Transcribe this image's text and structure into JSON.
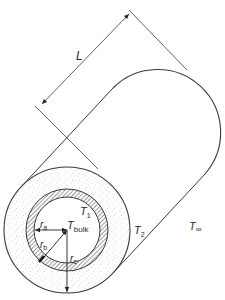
{
  "figure": {
    "type": "insulated pipe cross-section with cylinder length",
    "labels": {
      "length": "L",
      "r_a": {
        "main": "r",
        "sub": "a"
      },
      "r_b": {
        "main": "r",
        "sub": "b"
      },
      "r_c": {
        "main": "r",
        "sub": "c"
      },
      "t_bulk": {
        "main": "T",
        "sub": "bulk"
      },
      "t_1": {
        "main": "T",
        "sub": "1"
      },
      "t_2": {
        "main": "T",
        "sub": "2"
      },
      "t_inf": {
        "main": "T",
        "sub": "∞"
      }
    },
    "regions": [
      {
        "name": "fluid-core",
        "description": "inner fluid at T_bulk, radius r_a"
      },
      {
        "name": "pipe-wall",
        "description": "hatched annulus between r_a and r_b"
      },
      {
        "name": "insulation",
        "description": "stippled annulus between r_b and r_c"
      },
      {
        "name": "ambient",
        "description": "surroundings at T_inf"
      }
    ],
    "colors": {
      "line": "#3a3a3a",
      "text": "#2a2a2a",
      "background": "#ffffff",
      "stipple": "#9a9a9a"
    }
  }
}
